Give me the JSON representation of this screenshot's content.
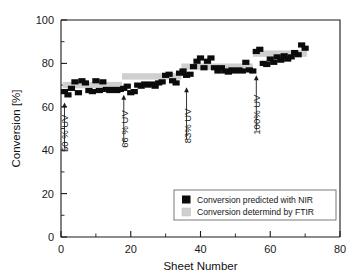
{
  "chart_data": {
    "type": "scatter",
    "title": "",
    "xlabel": "Sheet Number",
    "ylabel": "Conversion [%]",
    "xlim": [
      0,
      80
    ],
    "ylim": [
      0,
      100
    ],
    "xticks": [
      0,
      20,
      40,
      60,
      80
    ],
    "yticks": [
      0,
      20,
      40,
      60,
      80,
      100
    ],
    "xtick_labels": [
      "0",
      "20",
      "40",
      "60",
      "80"
    ],
    "ytick_labels": [
      "0",
      "20",
      "40",
      "60",
      "80",
      "100"
    ],
    "x_minor_step": 10,
    "y_minor_step": 10,
    "grid": false,
    "legend_position": "lower right",
    "legend": [
      {
        "label": "Conversion predicted with NIR",
        "marker": "square",
        "color": "#0b0b0b"
      },
      {
        "label": "Conversion determind by FTIR",
        "marker": "square",
        "color": "#cfcfcf"
      }
    ],
    "series": [
      {
        "name": "Conversion predicted with NIR",
        "type": "scatter",
        "marker": "square",
        "color": "#0b0b0b",
        "points": [
          {
            "x": 1,
            "y": 67.0
          },
          {
            "x": 2,
            "y": 65.5
          },
          {
            "x": 3,
            "y": 68.5
          },
          {
            "x": 4,
            "y": 71.5
          },
          {
            "x": 5,
            "y": 66.5
          },
          {
            "x": 6,
            "y": 72.0
          },
          {
            "x": 7,
            "y": 71.0
          },
          {
            "x": 8,
            "y": 67.5
          },
          {
            "x": 9,
            "y": 67.0
          },
          {
            "x": 10,
            "y": 72.0
          },
          {
            "x": 11,
            "y": 67.5
          },
          {
            "x": 12,
            "y": 71.5
          },
          {
            "x": 13,
            "y": 68.0
          },
          {
            "x": 14,
            "y": 67.5
          },
          {
            "x": 15,
            "y": 68.0
          },
          {
            "x": 16,
            "y": 67.5
          },
          {
            "x": 17,
            "y": 68.0
          },
          {
            "x": 18,
            "y": 68.5
          },
          {
            "x": 19,
            "y": 69.5
          },
          {
            "x": 20,
            "y": 66.5
          },
          {
            "x": 21,
            "y": 67.0
          },
          {
            "x": 22,
            "y": 70.0
          },
          {
            "x": 23,
            "y": 69.5
          },
          {
            "x": 24,
            "y": 70.5
          },
          {
            "x": 25,
            "y": 70.0
          },
          {
            "x": 26,
            "y": 70.5
          },
          {
            "x": 27,
            "y": 69.5
          },
          {
            "x": 28,
            "y": 71.0
          },
          {
            "x": 29,
            "y": 71.5
          },
          {
            "x": 30,
            "y": 74.5
          },
          {
            "x": 31,
            "y": 75.0
          },
          {
            "x": 32,
            "y": 72.0
          },
          {
            "x": 33,
            "y": 71.0
          },
          {
            "x": 34,
            "y": 75.5
          },
          {
            "x": 35,
            "y": 76.5
          },
          {
            "x": 36,
            "y": 74.5
          },
          {
            "x": 37,
            "y": 75.0
          },
          {
            "x": 38,
            "y": 78.5
          },
          {
            "x": 39,
            "y": 81.0
          },
          {
            "x": 40,
            "y": 82.5
          },
          {
            "x": 41,
            "y": 78.0
          },
          {
            "x": 42,
            "y": 81.0
          },
          {
            "x": 43,
            "y": 82.5
          },
          {
            "x": 44,
            "y": 78.0
          },
          {
            "x": 45,
            "y": 76.5
          },
          {
            "x": 46,
            "y": 78.0
          },
          {
            "x": 47,
            "y": 76.5
          },
          {
            "x": 48,
            "y": 76.0
          },
          {
            "x": 49,
            "y": 77.0
          },
          {
            "x": 50,
            "y": 76.5
          },
          {
            "x": 51,
            "y": 77.0
          },
          {
            "x": 52,
            "y": 76.5
          },
          {
            "x": 53,
            "y": 80.5
          },
          {
            "x": 54,
            "y": 77.0
          },
          {
            "x": 55,
            "y": 76.5
          },
          {
            "x": 56,
            "y": 85.5
          },
          {
            "x": 57,
            "y": 86.5
          },
          {
            "x": 58,
            "y": 80.0
          },
          {
            "x": 59,
            "y": 79.5
          },
          {
            "x": 60,
            "y": 82.0
          },
          {
            "x": 61,
            "y": 80.5
          },
          {
            "x": 62,
            "y": 83.0
          },
          {
            "x": 63,
            "y": 81.5
          },
          {
            "x": 64,
            "y": 83.5
          },
          {
            "x": 65,
            "y": 82.0
          },
          {
            "x": 66,
            "y": 83.0
          },
          {
            "x": 67,
            "y": 85.0
          },
          {
            "x": 68,
            "y": 84.0
          },
          {
            "x": 69,
            "y": 88.5
          },
          {
            "x": 70,
            "y": 87.0
          }
        ]
      },
      {
        "name": "Conversion determind by FTIR",
        "type": "band",
        "color": "#cfcfcf",
        "segments": [
          {
            "x_start": 0.5,
            "x_end": 17.5,
            "y": 70.0
          },
          {
            "x_start": 17.5,
            "x_end": 34.5,
            "y": 74.0
          },
          {
            "x_start": 34.5,
            "x_end": 55.0,
            "y": 78.5
          },
          {
            "x_start": 55.0,
            "x_end": 70.5,
            "y": 84.5
          }
        ]
      }
    ],
    "annotations": [
      {
        "label": "50 % UV",
        "x": 1,
        "y_tip": 62.0,
        "y_tail": 41.0
      },
      {
        "label": "66 % UV",
        "x": 18,
        "y_tip": 65.5,
        "y_tail": 43.0
      },
      {
        "label": "83% UV",
        "x": 36,
        "y_tip": 69.0,
        "y_tail": 45.0
      },
      {
        "label": "100% UV",
        "x": 56,
        "y_tip": 74.5,
        "y_tail": 49.0
      }
    ]
  }
}
